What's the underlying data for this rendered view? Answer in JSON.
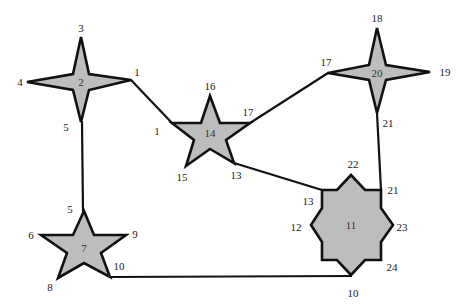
{
  "diagram": {
    "type": "graph of star-shaped nodes connected by edges",
    "colors": {
      "shape_fill": "#bdbdbd",
      "stroke": "#111111",
      "background": "#ffffff"
    },
    "nodes": [
      {
        "id": "2",
        "shape": "4-point-star",
        "center_label": "2",
        "points": "81,37 89,74 131,80 89,90 81,122 73,90 27,82 73,74",
        "label_pos": [
          81,
          86
        ],
        "vertex_labels": [
          {
            "text": "3",
            "x": 81,
            "y": 32
          },
          {
            "text": "4",
            "x": 20,
            "y": 86
          },
          {
            "text": "1",
            "x": 137,
            "y": 76
          },
          {
            "text": "5",
            "x": 66,
            "y": 131
          }
        ]
      },
      {
        "id": "14",
        "shape": "5-point-star",
        "center_label": "14",
        "points": "210,96 220,123 250,123 226,140 234,163 210,149 186,166 194,140 172,123 201,123",
        "label_pos": [
          210,
          137
        ],
        "vertex_labels": [
          {
            "text": "16",
            "x": 210,
            "y": 90
          },
          {
            "text": "17",
            "x": 248,
            "y": 116
          },
          {
            "text": "1",
            "x": 157,
            "y": 135
          },
          {
            "text": "15",
            "x": 182,
            "y": 181
          },
          {
            "text": "13",
            "x": 236,
            "y": 179
          }
        ]
      },
      {
        "id": "20",
        "shape": "4-point-star",
        "center_label": "20",
        "points": "377,28 386,65 430,72 386,80 377,113 369,80 328,73 369,65",
        "label_pos": [
          377,
          77
        ],
        "vertex_labels": [
          {
            "text": "18",
            "x": 377,
            "y": 22
          },
          {
            "text": "17",
            "x": 326,
            "y": 66
          },
          {
            "text": "19",
            "x": 445,
            "y": 76
          },
          {
            "text": "21",
            "x": 388,
            "y": 127
          }
        ]
      },
      {
        "id": "11",
        "shape": "8-point-star",
        "center_label": "11",
        "points": "351,175 365,190 381,190 381,208 393,225 381,242 381,260 365,260 351,275 337,260 322,260 322,242 311,225 322,208 322,190 337,190",
        "label_pos": [
          351,
          229
        ],
        "vertex_labels": [
          {
            "text": "22",
            "x": 353,
            "y": 168
          },
          {
            "text": "21",
            "x": 393,
            "y": 194
          },
          {
            "text": "13",
            "x": 308,
            "y": 205
          },
          {
            "text": "12",
            "x": 296,
            "y": 231
          },
          {
            "text": "23",
            "x": 402,
            "y": 231
          },
          {
            "text": "24",
            "x": 392,
            "y": 271
          },
          {
            "text": "10",
            "x": 353,
            "y": 297
          }
        ]
      },
      {
        "id": "7",
        "shape": "5-point-star",
        "center_label": "7",
        "points": "84,211 94,235 126,235 101,253 110,277 84,263 58,278 67,253 41,235 73,235",
        "label_pos": [
          84,
          252
        ],
        "vertex_labels": [
          {
            "text": "5",
            "x": 70,
            "y": 213
          },
          {
            "text": "6",
            "x": 31,
            "y": 239
          },
          {
            "text": "9",
            "x": 135,
            "y": 238
          },
          {
            "text": "10",
            "x": 119,
            "y": 270
          },
          {
            "text": "8",
            "x": 50,
            "y": 291
          }
        ]
      }
    ],
    "edges": [
      {
        "from": "2",
        "to": "14",
        "label": "1",
        "x1": 131,
        "y1": 80,
        "x2": 172,
        "y2": 123
      },
      {
        "from": "2",
        "to": "7",
        "label": "5",
        "x1": 82,
        "y1": 122,
        "x2": 83,
        "y2": 211
      },
      {
        "from": "14",
        "to": "20",
        "label": "17",
        "x1": 250,
        "y1": 123,
        "x2": 328,
        "y2": 73
      },
      {
        "from": "14",
        "to": "11",
        "label": "13",
        "x1": 234,
        "y1": 163,
        "x2": 322,
        "y2": 190
      },
      {
        "from": "20",
        "to": "11",
        "label": "21",
        "x1": 377,
        "y1": 113,
        "x2": 381,
        "y2": 190
      },
      {
        "from": "7",
        "to": "11",
        "label": "10",
        "x1": 110,
        "y1": 277,
        "x2": 351,
        "y2": 276
      }
    ]
  }
}
